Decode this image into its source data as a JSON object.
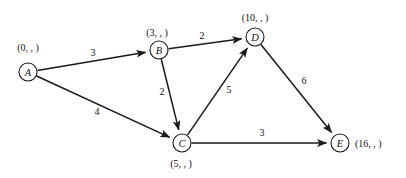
{
  "figure": {
    "type": "directed-weighted-graph",
    "background_color": "#ffffff",
    "ink_color": "#1a1a1a"
  },
  "nodes": [
    {
      "id": "A",
      "letter": "A",
      "tuple": "(0, , )",
      "cx": 28,
      "cy": 72,
      "r": 9,
      "label_x": 28,
      "label_y": 47,
      "label_anchor": "middle"
    },
    {
      "id": "B",
      "letter": "B",
      "tuple": "(3, , )",
      "cx": 159,
      "cy": 50,
      "r": 9,
      "label_x": 157,
      "label_y": 32,
      "label_anchor": "middle"
    },
    {
      "id": "C",
      "letter": "C",
      "tuple": "(5, , )",
      "cx": 182,
      "cy": 143,
      "r": 9,
      "label_x": 181,
      "label_y": 163,
      "label_anchor": "middle"
    },
    {
      "id": "D",
      "letter": "D",
      "tuple": "(10, , )",
      "cx": 255,
      "cy": 37,
      "r": 9,
      "label_x": 255,
      "label_y": 17,
      "label_anchor": "middle"
    },
    {
      "id": "E",
      "letter": "E",
      "tuple": "(16, , )",
      "cx": 340,
      "cy": 143,
      "r": 9,
      "label_x": 355,
      "label_y": 143,
      "label_anchor": "start"
    }
  ],
  "edges": [
    {
      "id": "A-B",
      "from": "A",
      "to": "B",
      "weight": "3",
      "weight_x": 93,
      "weight_y": 52
    },
    {
      "id": "A-C",
      "from": "A",
      "to": "C",
      "weight": "4",
      "weight_x": 97,
      "weight_y": 111
    },
    {
      "id": "B-D",
      "from": "B",
      "to": "D",
      "weight": "2",
      "weight_x": 202,
      "weight_y": 35
    },
    {
      "id": "B-C",
      "from": "B",
      "to": "C",
      "weight": "2",
      "weight_x": 162,
      "weight_y": 91
    },
    {
      "id": "C-D",
      "from": "C",
      "to": "D",
      "weight": "5",
      "weight_x": 229,
      "weight_y": 89
    },
    {
      "id": "C-E",
      "from": "C",
      "to": "E",
      "weight": "3",
      "weight_x": 262,
      "weight_y": 132
    },
    {
      "id": "D-E",
      "from": "D",
      "to": "E",
      "weight": "6",
      "weight_x": 304,
      "weight_y": 80
    }
  ]
}
